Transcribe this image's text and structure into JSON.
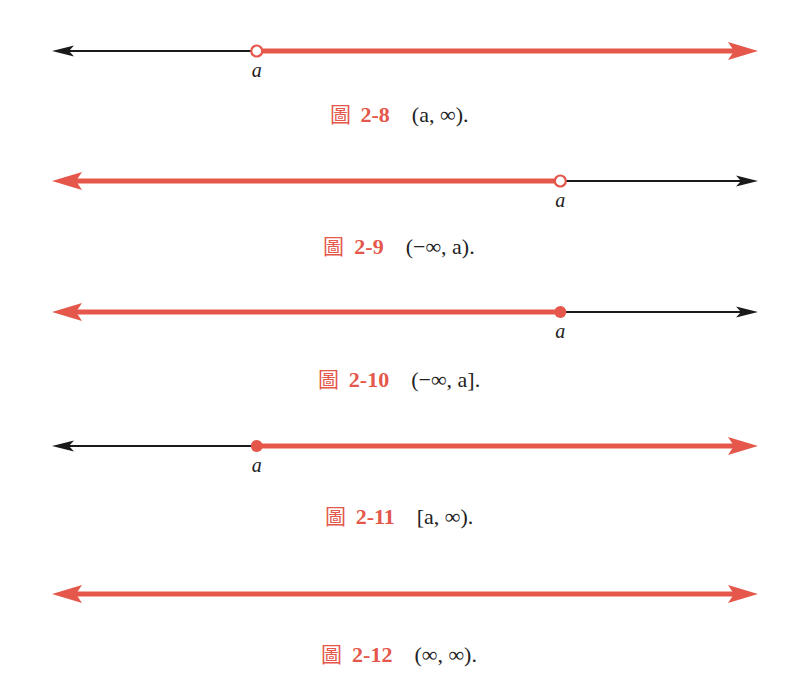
{
  "colors": {
    "highlight": "#e4574a",
    "axis": "#1a1a1a"
  },
  "figures": [
    {
      "fig_char": "圖",
      "number": "2-8",
      "interval": "(a,  ∞).",
      "point_label": "a",
      "point_pos": 0.29,
      "point_type": "open",
      "shaded": "right"
    },
    {
      "fig_char": "圖",
      "number": "2-9",
      "interval": "(−∞,  a).",
      "point_label": "a",
      "point_pos": 0.72,
      "point_type": "open",
      "shaded": "left"
    },
    {
      "fig_char": "圖",
      "number": "2-10",
      "interval": "(−∞,  a].",
      "point_label": "a",
      "point_pos": 0.72,
      "point_type": "closed",
      "shaded": "left"
    },
    {
      "fig_char": "圖",
      "number": "2-11",
      "interval": "[a,  ∞).",
      "point_label": "a",
      "point_pos": 0.29,
      "point_type": "closed",
      "shaded": "right"
    },
    {
      "fig_char": "圖",
      "number": "2-12",
      "interval": "(∞,  ∞).",
      "point_label": "",
      "point_pos": null,
      "point_type": "none",
      "shaded": "all"
    }
  ]
}
